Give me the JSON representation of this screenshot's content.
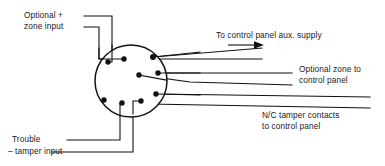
{
  "diagram": {
    "stroke_color": "#111111",
    "background_color": "#ffffff",
    "labels": {
      "optional_plus": "Optional +",
      "zone_input": "zone input",
      "trouble": "Trouble",
      "tamper_input": "– tamper input",
      "aux_supply": "To control panel aux. supply",
      "optional_zone": "Optional zone to",
      "control_panel": "control panel",
      "nc_tamper": "N/C tamper contacts",
      "nc_to_control_panel": "to control panel"
    },
    "connector": {
      "name": "circular-connector",
      "center_x": 131,
      "center_y": 81,
      "radius": 36,
      "pin_count": 8,
      "pin_radius": 2.6,
      "pins": [
        {
          "id": "pin-1",
          "x": 108,
          "y": 62
        },
        {
          "id": "pin-2",
          "x": 124,
          "y": 59
        },
        {
          "id": "pin-3",
          "x": 153,
          "y": 57
        },
        {
          "id": "pin-4",
          "x": 139,
          "y": 75
        },
        {
          "id": "pin-5",
          "x": 158,
          "y": 73
        },
        {
          "id": "pin-6",
          "x": 156,
          "y": 94
        },
        {
          "id": "pin-7",
          "x": 104,
          "y": 100
        },
        {
          "id": "pin-8",
          "x": 122,
          "y": 103
        },
        {
          "id": "pin-9",
          "x": 141,
          "y": 101
        }
      ]
    },
    "wires": {
      "left_top_1": {
        "y": 16,
        "x_end": 112
      },
      "left_top_2": {
        "y": 27,
        "x_end": 99
      },
      "left_bottom_1": {
        "y": 140,
        "x_start": 67,
        "x_end": 120
      },
      "left_bottom_2": {
        "y": 152,
        "x_start": 52,
        "x_end": 133
      },
      "right_lines": [
        {
          "id": "wire-aux-supply-1",
          "y": 48,
          "x_start": 158,
          "x_end": 262
        },
        {
          "id": "wire-aux-supply-2",
          "y": 59,
          "x_start": 150,
          "x_end": 262
        },
        {
          "id": "wire-optional-zone-1",
          "y": 73,
          "x_start": 160,
          "x_end": 292
        },
        {
          "id": "wire-optional-zone-2",
          "y": 85,
          "x_start": 140,
          "x_end": 292
        },
        {
          "id": "wire-nc-tamper-1",
          "y": 97,
          "x_start": 157,
          "x_end": 370
        },
        {
          "id": "wire-nc-tamper-2",
          "y": 108,
          "x_start": 149,
          "x_end": 370
        }
      ],
      "arrow": {
        "id": "aux-supply-arrow",
        "x_start": 228,
        "x_end": 262,
        "y": 45
      }
    }
  }
}
